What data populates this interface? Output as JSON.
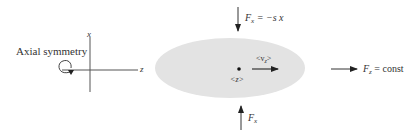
{
  "diagram": {
    "axes": {
      "x_label": "x",
      "z_label": "z",
      "symmetry_label": "Axial symmetry"
    },
    "beam": {
      "color": "#e3e3e3",
      "center_label": "<z>",
      "velocity_label_main": "<v",
      "velocity_label_sub": "z",
      "velocity_label_end": ">"
    },
    "forces": {
      "top": {
        "symbol": "F",
        "sub": "x",
        "rhs": " = −s x"
      },
      "bottom": {
        "symbol": "F",
        "sub": "x"
      },
      "right": {
        "symbol": "F",
        "sub": "z",
        "rhs": " = const"
      }
    }
  }
}
